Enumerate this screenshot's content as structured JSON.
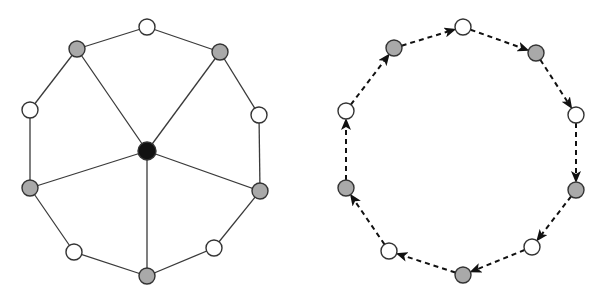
{
  "colors": {
    "background": "#ffffff",
    "edge": "#3a3a3a",
    "node_stroke": "#333333",
    "white_node": "#ffffff",
    "gray_node": "#a9a9a9",
    "black_node": "#111111",
    "arrow": "#111111"
  },
  "node_radius": 8,
  "center_radius": 9,
  "diagrams": [
    {
      "id": "wheel-graph",
      "description": "Undirected wheel-like graph: 10 boundary nodes in a cycle, alternating white and gray, with a black hub connected to the 5 gray nodes",
      "hub": {
        "x": 147,
        "y": 151,
        "type": "black"
      },
      "nodes": [
        {
          "x": 147,
          "y": 27,
          "type": "white"
        },
        {
          "x": 220,
          "y": 52,
          "type": "gray"
        },
        {
          "x": 259,
          "y": 115,
          "type": "white"
        },
        {
          "x": 260,
          "y": 191,
          "type": "gray"
        },
        {
          "x": 214,
          "y": 248,
          "type": "white"
        },
        {
          "x": 147,
          "y": 276,
          "type": "gray"
        },
        {
          "x": 74,
          "y": 252,
          "type": "white"
        },
        {
          "x": 30,
          "y": 188,
          "type": "gray"
        },
        {
          "x": 30,
          "y": 110,
          "type": "white"
        },
        {
          "x": 77,
          "y": 49,
          "type": "gray"
        }
      ],
      "edges": "cycle+hub-to-gray",
      "edge_style": "solid"
    },
    {
      "id": "directed-cycle",
      "description": "Directed cycle of 10 nodes alternating white and gray, connected by dashed arrows in clockwise order",
      "nodes": [
        {
          "x": 463,
          "y": 27,
          "type": "white"
        },
        {
          "x": 536,
          "y": 53,
          "type": "gray"
        },
        {
          "x": 576,
          "y": 115,
          "type": "white"
        },
        {
          "x": 576,
          "y": 190,
          "type": "gray"
        },
        {
          "x": 532,
          "y": 247,
          "type": "white"
        },
        {
          "x": 463,
          "y": 275,
          "type": "gray"
        },
        {
          "x": 389,
          "y": 251,
          "type": "white"
        },
        {
          "x": 346,
          "y": 188,
          "type": "gray"
        },
        {
          "x": 346,
          "y": 111,
          "type": "white"
        },
        {
          "x": 394,
          "y": 48,
          "type": "gray"
        }
      ],
      "edges": "cycle",
      "direction": "clockwise",
      "edge_style": "dashed-arrow"
    }
  ]
}
